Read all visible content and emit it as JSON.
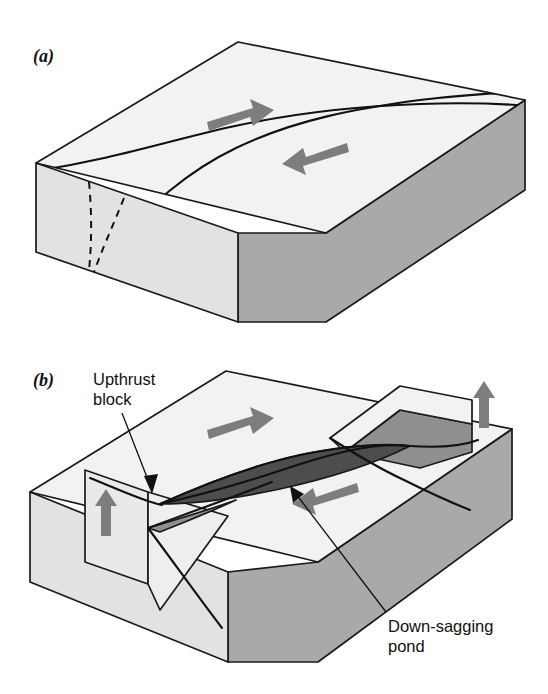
{
  "figure": {
    "title_visible": false,
    "background_color": "#ffffff",
    "panels": [
      {
        "id": "a",
        "label": "(a)",
        "description": "Undeformed block with two intersecting strike-slip fault traces on the top surface and opposing lateral motion arrows",
        "annotations": [],
        "motion_arrows": [
          {
            "name": "right-lateral-arrow",
            "direction": "right"
          },
          {
            "name": "left-lateral-arrow",
            "direction": "left"
          }
        ]
      },
      {
        "id": "b",
        "label": "(b)",
        "description": "Deformed block showing an upthrust block raised along the fault bends and a dark down-sagging pond depression between the fault strands",
        "annotations": [
          {
            "name": "upthrust-block-label",
            "line1": "Upthrust",
            "line2": "block"
          },
          {
            "name": "down-sagging-pond-label",
            "line1": "Down-sagging",
            "line2": "pond"
          }
        ],
        "motion_arrows": [
          {
            "name": "right-lateral-arrow",
            "direction": "right"
          },
          {
            "name": "left-lateral-arrow",
            "direction": "left"
          },
          {
            "name": "uplift-arrow-left",
            "direction": "up"
          },
          {
            "name": "uplift-arrow-right",
            "direction": "up"
          }
        ]
      }
    ]
  },
  "colors": {
    "top_face": "#f2f2f2",
    "left_face": "#e2e2e2",
    "front_face": "#a9a9a9",
    "pond_fill": "#4d4d4d",
    "upthrust_side": "#8f8f8f",
    "outline": "#1a1a1a",
    "arrow_gray": "#7d7d7d",
    "text": "#111111",
    "background": "#ffffff"
  },
  "labels": {
    "panel_a": "(a)",
    "panel_b": "(b)",
    "upthrust_line1": "Upthrust",
    "upthrust_line2": "block",
    "pond_line1": "Down-sagging",
    "pond_line2": "pond"
  }
}
